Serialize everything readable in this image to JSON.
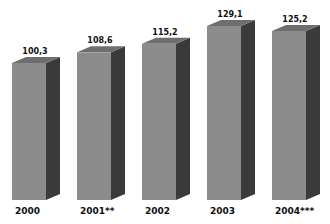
{
  "chart_data": {
    "type": "bar",
    "title": "",
    "xlabel": "",
    "ylabel": "",
    "categories": [
      "2000",
      "2001**",
      "2002",
      "2003",
      "2004***"
    ],
    "values": [
      100.3,
      108.6,
      115.2,
      129.1,
      125.2
    ],
    "value_labels": [
      "100,3",
      "108,6",
      "115,2",
      "129,1",
      "125,2"
    ],
    "style": "3d-bar",
    "grid": false,
    "legend": null,
    "colors": {
      "front": "#8c8c8c",
      "side": "#3a3a3a",
      "top": "#6e6e6e"
    }
  }
}
